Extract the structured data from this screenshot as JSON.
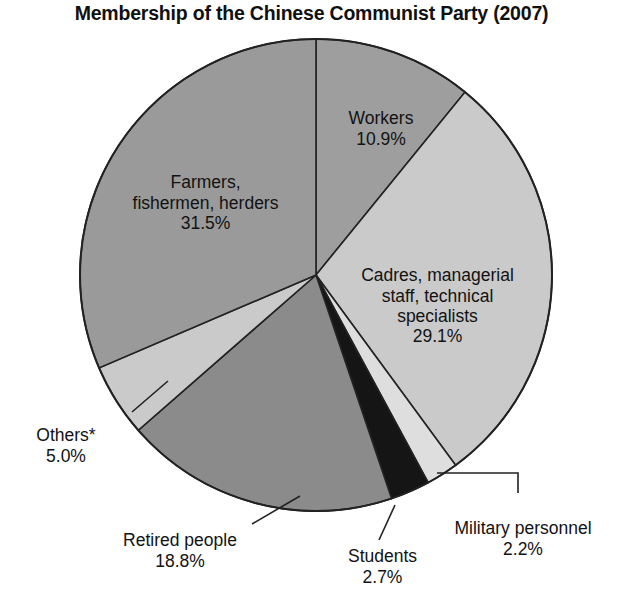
{
  "chart_data": {
    "type": "pie",
    "title": "Membership of the Chinese Communist Party (2007)",
    "xlabel": "",
    "ylabel": "",
    "legend_position": "none",
    "grid": false,
    "start_angle_deg": 0,
    "direction": "clockwise",
    "units": "percent",
    "footnote_marker": "*",
    "categories": [
      "Workers",
      "Cadres, managerial staff, technical specialists",
      "Military personnel",
      "Students",
      "Retired people",
      "Others*",
      "Farmers, fishermen, herders"
    ],
    "values": [
      10.9,
      29.1,
      2.2,
      2.7,
      18.8,
      5.0,
      31.5
    ],
    "slices": [
      {
        "name": "workers",
        "label": "Workers",
        "value": 10.9,
        "value_text": "10.9%",
        "color": "#9e9e9e",
        "label_position": "inside"
      },
      {
        "name": "cadres",
        "label": "Cadres, managerial\nstaff, technical\nspecialists",
        "value": 29.1,
        "value_text": "29.1%",
        "color": "#cacaca",
        "label_position": "inside"
      },
      {
        "name": "military-personnel",
        "label": "Military personnel",
        "value": 2.2,
        "value_text": "2.2%",
        "color": "#dedede",
        "label_position": "outside"
      },
      {
        "name": "students",
        "label": "Students",
        "value": 2.7,
        "value_text": "2.7%",
        "color": "#151515",
        "label_position": "outside"
      },
      {
        "name": "retired-people",
        "label": "Retired people",
        "value": 18.8,
        "value_text": "18.8%",
        "color": "#8b8b8b",
        "label_position": "outside"
      },
      {
        "name": "others",
        "label": "Others*",
        "value": 5.0,
        "value_text": "5.0%",
        "color": "#cacaca",
        "label_position": "outside"
      },
      {
        "name": "farmers-fishermen-herders",
        "label": "Farmers,\nfishermen, herders",
        "value": 31.5,
        "value_text": "31.5%",
        "color": "#9a9a9a",
        "label_position": "inside"
      }
    ],
    "geometry": {
      "center_x": 316,
      "center_y": 275,
      "radius": 236,
      "outline_color": "#222222"
    }
  }
}
